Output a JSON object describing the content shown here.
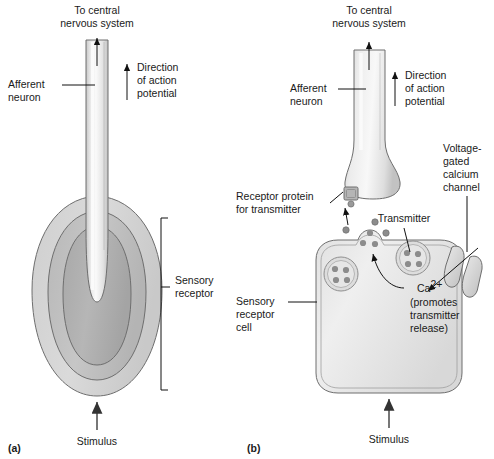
{
  "figure": {
    "title_alt": "Sensory receptor types: specialized afferent neuron ending and separate receptor cell",
    "background_color": "#ffffff",
    "line_color": "#111111",
    "outline_color": "#6e6e6e"
  },
  "palette": {
    "lamella_outer": "#d6d6d6",
    "lamella_middle": "#bfbfbf",
    "lamella_inner": "#afafaf",
    "neuron_light": "#f2f2f2",
    "neuron_mid": "#dcdcdc",
    "neuron_shadow": "#c4c4c4",
    "cell_fill": "#e8e8e8",
    "vesicle_fill": "#dddddd",
    "transmitter_dot": "#8c8c8c",
    "channel_fill": "#d8d8d8",
    "receptor_protein": "#b5b5b5"
  },
  "panel_a": {
    "label": "(a)",
    "labels": {
      "to_cns_line1": "To central",
      "to_cns_line2": "nervous system",
      "afferent_line1": "Afferent",
      "afferent_line2": "neuron",
      "direction_line1": "Direction",
      "direction_line2": "of action",
      "direction_line3": "potential",
      "sensory_receptor_line1": "Sensory",
      "sensory_receptor_line2": "receptor",
      "stimulus": "Stimulus"
    }
  },
  "panel_b": {
    "label": "(b)",
    "labels": {
      "to_cns_line1": "To central",
      "to_cns_line2": "nervous system",
      "afferent_line1": "Afferent",
      "afferent_line2": "neuron",
      "direction_line1": "Direction",
      "direction_line2": "of action",
      "direction_line3": "potential",
      "receptor_protein_line1": "Receptor protein",
      "receptor_protein_line2": "for transmitter",
      "voltage_gated_line1": "Voltage-",
      "voltage_gated_line2": "gated",
      "voltage_gated_line3": "calcium",
      "voltage_gated_line4": "channel",
      "transmitter": "Transmitter",
      "calcium_ion_base": "Ca",
      "calcium_ion_sup": "2+",
      "calcium_note_line1": "(promotes",
      "calcium_note_line2": "transmitter",
      "calcium_note_line3": "release)",
      "sensory_receptor_cell_line1": "Sensory",
      "sensory_receptor_cell_line2": "receptor",
      "sensory_receptor_cell_line3": "cell",
      "stimulus": "Stimulus"
    },
    "counts": {
      "vesicles": 3,
      "transmitter_dots_per_vesicle": 4,
      "free_transmitter_dots": 6
    }
  }
}
